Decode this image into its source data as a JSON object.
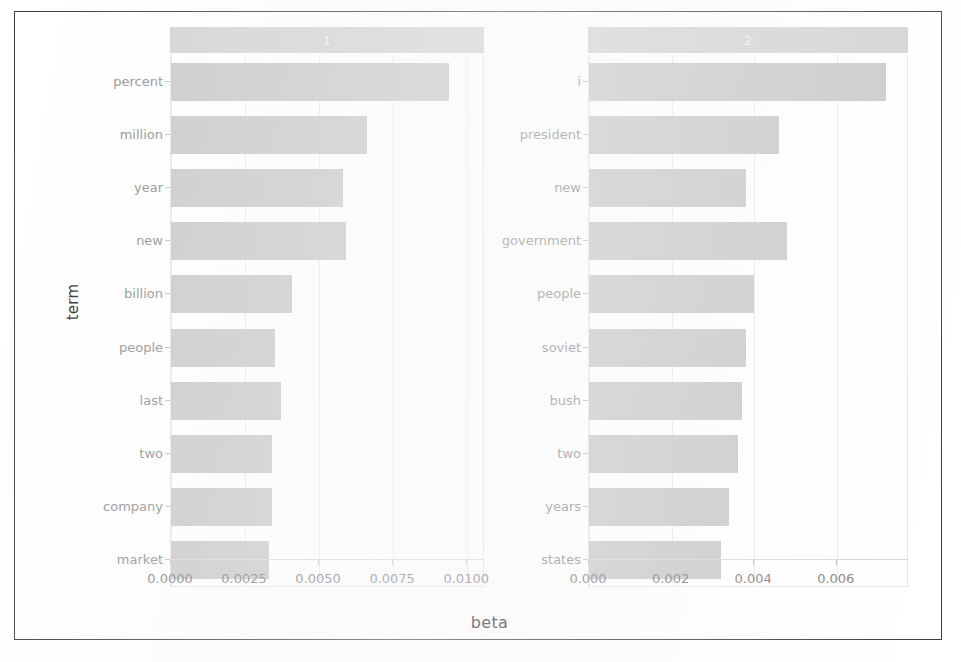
{
  "figure": {
    "x_axis_title": "beta",
    "y_axis_title": "term"
  },
  "chart_data": {
    "type": "bar",
    "title": "",
    "subtitle": "",
    "xlabel": "beta",
    "ylabel": "term",
    "orientation": "horizontal",
    "grid": true,
    "legend": "none",
    "facets": [
      {
        "strip_label": "1",
        "categories": [
          "percent",
          "million",
          "year",
          "new",
          "billion",
          "people",
          "last",
          "two",
          "company",
          "market"
        ],
        "values": [
          0.0094,
          0.0066,
          0.0058,
          0.0059,
          0.0041,
          0.0035,
          0.0037,
          0.0034,
          0.0034,
          0.0033
        ],
        "xlim": [
          0.0,
          0.0106
        ],
        "xticks": [
          0.0,
          0.0025,
          0.005,
          0.0075,
          0.01
        ],
        "xticklabels": [
          "0.0000",
          "0.0025",
          "0.0050",
          "0.0075",
          "0.0100"
        ]
      },
      {
        "strip_label": "2",
        "categories": [
          "i",
          "president",
          "new",
          "government",
          "people",
          "soviet",
          "bush",
          "two",
          "years",
          "states"
        ],
        "values": [
          0.0072,
          0.0046,
          0.0038,
          0.0048,
          0.004,
          0.0038,
          0.0037,
          0.0036,
          0.0034,
          0.0032
        ],
        "xlim": [
          0.0,
          0.00775
        ],
        "xticks": [
          0.0,
          0.002,
          0.004,
          0.006
        ],
        "xticklabels": [
          "0.000",
          "0.002",
          "0.004",
          "0.006"
        ]
      }
    ]
  },
  "colors": {
    "bar_fill": "#c9c9c9",
    "strip_background": "#d3d3d3",
    "strip_text": "#f2f2f2",
    "panel_background": "#ffffff",
    "gridline": "#f0f0f0",
    "axis_text": "#7d7d7d",
    "frame_border": "#3a3a3a"
  }
}
